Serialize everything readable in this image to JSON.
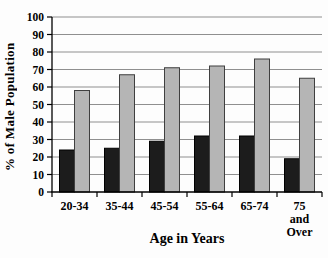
{
  "chart_data": {
    "type": "bar",
    "title": "",
    "xlabel": "Age in Years",
    "ylabel": "% of Male Population",
    "categories": [
      "20-34",
      "35-44",
      "45-54",
      "55-64",
      "65-74",
      "75 and Over"
    ],
    "series": [
      {
        "name": "black-bars",
        "color": "#1c1c1c",
        "outline": "#000000",
        "values": [
          24,
          25,
          29,
          32,
          32,
          19
        ]
      },
      {
        "name": "gray-bars",
        "color": "#b5b5b5",
        "outline": "#3f3f3f",
        "values": [
          58,
          67,
          71,
          72,
          76,
          65
        ]
      }
    ],
    "ylim": [
      0,
      100
    ],
    "yticks": [
      0,
      10,
      20,
      30,
      40,
      50,
      60,
      70,
      80,
      90,
      100
    ],
    "grid": "horizontal",
    "legend": "none",
    "colors": {
      "gridline": "#8f8f8f",
      "axis": "#000000",
      "tick_label": "#000000",
      "background": "#fdfdfd"
    }
  }
}
